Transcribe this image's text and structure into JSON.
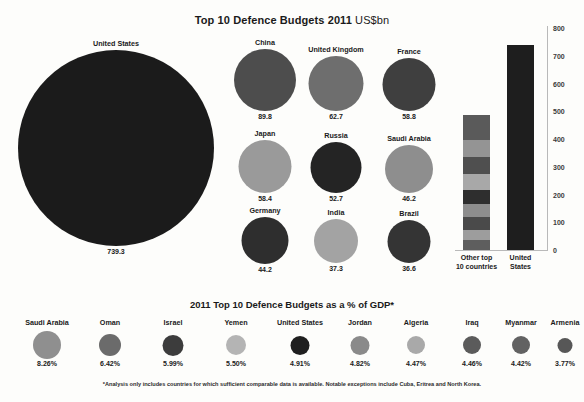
{
  "header": {
    "title_main": "Top 10 Defence Budgets 2011 ",
    "title_unit": "US$bn"
  },
  "gdp_section": {
    "subtitle": "2011 Top 10 Defence Budgets as a % of GDP*"
  },
  "footnote": "*Analysis only includes countries for which sufficient comparable data is available. Notable exceptions include Cuba, Eritrea and North Korea.",
  "chart_data": [
    {
      "type": "bubble",
      "title": "Top 10 Defence Budgets 2011 US$bn",
      "unit": "US$bn",
      "categories": [
        "United States",
        "China",
        "United Kingdom",
        "France",
        "Japan",
        "Russia",
        "Saudi Arabia",
        "Germany",
        "India",
        "Brazil"
      ],
      "values": [
        739.3,
        89.8,
        62.7,
        58.8,
        58.4,
        52.7,
        46.2,
        44.2,
        37.3,
        36.6
      ],
      "labels": [
        "739.3",
        "89.8",
        "62.7",
        "58.8",
        "58.4",
        "52.7",
        "46.2",
        "44.2",
        "37.3",
        "36.6"
      ],
      "colors": [
        "#1b1b1b",
        "#4d4d4d",
        "#6e6e6e",
        "#3f3f3f",
        "#9a9a9a",
        "#242424",
        "#8e8e8e",
        "#2e2e2e",
        "#a3a3a3",
        "#343434"
      ],
      "xlabel": "",
      "ylabel": "",
      "grid": false,
      "legend": "none"
    },
    {
      "type": "bar",
      "title": "",
      "categories": [
        "Other top\n10 countries",
        "United States"
      ],
      "values": [
        486.3,
        739.3
      ],
      "ylim": [
        0,
        800
      ],
      "yticks": [
        "0",
        "100",
        "200",
        "300",
        "400",
        "500",
        "600",
        "700",
        "800"
      ],
      "ytick_values": [
        0,
        100,
        200,
        300,
        400,
        500,
        600,
        700,
        800
      ],
      "xlabel": "",
      "ylabel": "",
      "grid": false,
      "legend": "none",
      "stacked": true,
      "series": [
        {
          "name": "Brazil",
          "values": [
            36.6,
            0
          ],
          "color": "#5e5e5e"
        },
        {
          "name": "India",
          "values": [
            37.3,
            0
          ],
          "color": "#9d9d9d"
        },
        {
          "name": "Germany",
          "values": [
            44.2,
            0
          ],
          "color": "#4a4a4a"
        },
        {
          "name": "Saudi Arabia",
          "values": [
            46.2,
            0
          ],
          "color": "#8d8d8d"
        },
        {
          "name": "Russia",
          "values": [
            52.7,
            0
          ],
          "color": "#3b3b3b"
        },
        {
          "name": "Japan",
          "values": [
            58.4,
            0
          ],
          "color": "#a8a8a8"
        },
        {
          "name": "France",
          "values": [
            58.8,
            0
          ],
          "color": "#4f4f4f"
        },
        {
          "name": "United Kingdom",
          "values": [
            62.7,
            0
          ],
          "color": "#949494"
        },
        {
          "name": "China",
          "values": [
            89.8,
            0
          ],
          "color": "#5a5a5a"
        },
        {
          "name": "United States",
          "values": [
            0,
            739.3
          ],
          "color": "#1e1e1e"
        }
      ]
    },
    {
      "type": "bubble",
      "title": "2011 Top 10 Defence Budgets as a % of GDP*",
      "categories": [
        "Saudi Arabia",
        "Oman",
        "Israel",
        "Yemen",
        "United States",
        "Jordan",
        "Algeria",
        "Iraq",
        "Myanmar",
        "Armenia"
      ],
      "values": [
        8.26,
        6.42,
        5.99,
        5.5,
        4.91,
        4.82,
        4.47,
        4.46,
        4.42,
        3.77
      ],
      "labels": [
        "8.26%",
        "6.42%",
        "5.99%",
        "5.50%",
        "4.91%",
        "4.82%",
        "4.47%",
        "4.46%",
        "4.42%",
        "3.77%"
      ],
      "colors": [
        "#8f8f8f",
        "#6b6b6b",
        "#3c3c3c",
        "#b4b4b4",
        "#1f1f1f",
        "#8a8a8a",
        "#a9a9a9",
        "#5b5b5b",
        "#626262",
        "#575757"
      ],
      "xlabel": "",
      "ylabel": "",
      "grid": false,
      "legend": "none"
    }
  ],
  "bubbles": [
    {
      "name": "United States",
      "value": "739.3",
      "d": 196,
      "cx": 116,
      "cy": 118,
      "color": "#1b1b1b"
    },
    {
      "name": "China",
      "value": "89.8",
      "d": 62,
      "cx": 265,
      "cy": 50,
      "color": "#4d4d4d"
    },
    {
      "name": "United Kingdom",
      "value": "62.7",
      "d": 55,
      "cx": 336,
      "cy": 53,
      "color": "#6e6e6e"
    },
    {
      "name": "France",
      "value": "58.8",
      "d": 53,
      "cx": 409,
      "cy": 54,
      "color": "#3f3f3f"
    },
    {
      "name": "Japan",
      "value": "58.4",
      "d": 53,
      "cx": 265,
      "cy": 136,
      "color": "#9a9a9a"
    },
    {
      "name": "Russia",
      "value": "52.7",
      "d": 51,
      "cx": 336,
      "cy": 137,
      "color": "#242424"
    },
    {
      "name": "Saudi Arabia",
      "value": "46.2",
      "d": 48,
      "cx": 409,
      "cy": 139,
      "color": "#8e8e8e"
    },
    {
      "name": "Germany",
      "value": "44.2",
      "d": 47,
      "cx": 265,
      "cy": 210,
      "color": "#2e2e2e"
    },
    {
      "name": "India",
      "value": "37.3",
      "d": 44,
      "cx": 336,
      "cy": 211,
      "color": "#a3a3a3"
    },
    {
      "name": "Brazil",
      "value": "36.6",
      "d": 43,
      "cx": 409,
      "cy": 211,
      "color": "#343434"
    }
  ],
  "barchart": {
    "yticks": [
      {
        "label": "800",
        "v": 800
      },
      {
        "label": "700",
        "v": 700
      },
      {
        "label": "600",
        "v": 600
      },
      {
        "label": "500",
        "v": 500
      },
      {
        "label": "400",
        "v": 400
      },
      {
        "label": "300",
        "v": 300
      },
      {
        "label": "200",
        "v": 200
      },
      {
        "label": "100",
        "v": 100
      },
      {
        "label": "0",
        "v": 0
      }
    ],
    "bars": [
      {
        "name": "Other top 10 countries",
        "caption": "Other top\n10 countries",
        "total": 486.3,
        "x": 8,
        "w": 27,
        "segments": [
          {
            "name": "China",
            "v": 89.8,
            "color": "#5a5a5a"
          },
          {
            "name": "United Kingdom",
            "v": 62.7,
            "color": "#949494"
          },
          {
            "name": "France",
            "v": 58.8,
            "color": "#4f4f4f"
          },
          {
            "name": "Japan",
            "v": 58.4,
            "color": "#a8a8a8"
          },
          {
            "name": "Russia",
            "v": 52.7,
            "color": "#2e2e2e"
          },
          {
            "name": "Saudi Arabia",
            "v": 46.2,
            "color": "#8d8d8d"
          },
          {
            "name": "Germany",
            "v": 44.2,
            "color": "#4a4a4a"
          },
          {
            "name": "India",
            "v": 37.3,
            "color": "#9d9d9d"
          },
          {
            "name": "Brazil",
            "v": 36.6,
            "color": "#5e5e5e"
          }
        ]
      },
      {
        "name": "United States",
        "caption": "United\nStates",
        "total": 739.3,
        "x": 52,
        "w": 27,
        "segments": [
          {
            "name": "United States",
            "v": 739.3,
            "color": "#1e1e1e"
          }
        ]
      }
    ]
  },
  "gdp_bubbles": [
    {
      "name": "Saudi Arabia",
      "value": "8.26%",
      "d": 28,
      "cx": 47,
      "color": "#8f8f8f"
    },
    {
      "name": "Oman",
      "value": "6.42%",
      "d": 22,
      "cx": 110,
      "color": "#6b6b6b"
    },
    {
      "name": "Israel",
      "value": "5.99%",
      "d": 21,
      "cx": 173,
      "cy": 0,
      "color": "#3c3c3c"
    },
    {
      "name": "Yemen",
      "value": "5.50%",
      "d": 20,
      "cx": 236,
      "color": "#b4b4b4"
    },
    {
      "name": "United States",
      "value": "4.91%",
      "d": 19,
      "cx": 300,
      "color": "#1f1f1f"
    },
    {
      "name": "Jordan",
      "value": "4.82%",
      "d": 19,
      "cx": 360,
      "color": "#8a8a8a"
    },
    {
      "name": "Algeria",
      "value": "4.47%",
      "d": 18,
      "cx": 416,
      "color": "#a9a9a9"
    },
    {
      "name": "Iraq",
      "value": "4.46%",
      "d": 18,
      "cx": 472,
      "color": "#5b5b5b"
    },
    {
      "name": "Myanmar",
      "value": "4.42%",
      "d": 18,
      "cx": 521,
      "color": "#626262"
    },
    {
      "name": "Armenia",
      "value": "3.77%",
      "d": 15,
      "cx": 565,
      "color": "#575757"
    }
  ]
}
